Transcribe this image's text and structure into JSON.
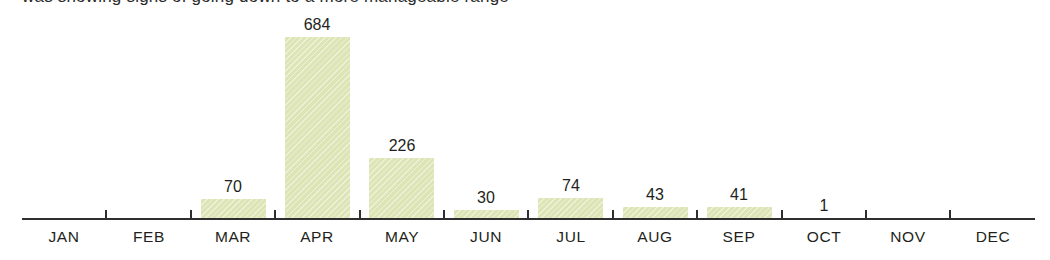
{
  "caption": {
    "text": "was showing signs of going down to a more manageable range"
  },
  "chart_data": {
    "type": "bar",
    "title": "",
    "subtitle": "",
    "xlabel": "",
    "ylabel": "",
    "categories": [
      "JAN",
      "FEB",
      "MAR",
      "APR",
      "MAY",
      "JUN",
      "JUL",
      "AUG",
      "SEP",
      "OCT",
      "NOV",
      "DEC"
    ],
    "values": [
      null,
      null,
      70,
      684,
      226,
      30,
      74,
      43,
      41,
      1,
      null,
      null
    ],
    "value_labels": [
      "",
      "",
      "70",
      "684",
      "226",
      "30",
      "74",
      "43",
      "41",
      "1",
      "",
      ""
    ],
    "ylim": [
      0,
      684
    ],
    "grid": false,
    "legend": null,
    "axis_line": true,
    "tick_marks_between_categories": true,
    "bar_color": "#dde5b6",
    "axis_color": "#2f2f2f",
    "label_color": "#231f20"
  }
}
